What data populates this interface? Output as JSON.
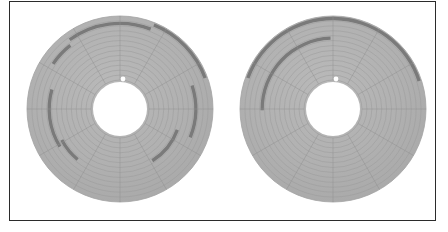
{
  "figure": {
    "kind": "disk-platter-allocation-diagram",
    "background_color": "#ffffff",
    "frame": {
      "border_color": "#2b2b2b",
      "border_width_px": 1,
      "x": 9,
      "y": 1,
      "width": 427,
      "height": 220
    },
    "colors": {
      "platter_fill": "#aeaeae",
      "platter_fill_light": "#b6b6b6",
      "track_line": "#9a9a9a",
      "sector_line": "#8f8f8f",
      "highlight_fill": "#7a7a7a",
      "hub_hole_fill": "#ffffff",
      "index_dot_fill": "#ffffff",
      "platter_edge": "#a2a2a2"
    },
    "geometry": {
      "track_count": 13,
      "sector_count": 12,
      "sector_start_angle_deg": -90
    },
    "platters": [
      {
        "name": "left-platter",
        "label": "fragmented-allocation",
        "cx": 120,
        "cy": 109,
        "r_outer": 93,
        "r_inner": 29,
        "hub_hole_r": 27,
        "index_dot": {
          "dx": 3,
          "dy": -30,
          "r": 2.4
        },
        "highlights": [
          {
            "name": "highlight-arc-1",
            "track": 12,
            "start_deg": -68,
            "end_deg": -20
          },
          {
            "name": "highlight-arc-2",
            "track": 11,
            "start_deg": -126,
            "end_deg": -69
          },
          {
            "name": "highlight-arc-3",
            "track": 10,
            "start_deg": -146,
            "end_deg": -128
          },
          {
            "name": "highlight-arc-4",
            "track": 9,
            "start_deg": -18,
            "end_deg": 22
          },
          {
            "name": "highlight-arc-5",
            "track": 8,
            "start_deg": 148,
            "end_deg": 196
          },
          {
            "name": "highlight-arc-6",
            "track": 7,
            "start_deg": 130,
            "end_deg": 152
          },
          {
            "name": "highlight-arc-7",
            "track": 6,
            "start_deg": 20,
            "end_deg": 58
          }
        ]
      },
      {
        "name": "right-platter",
        "label": "contiguous-allocation",
        "cx": 333,
        "cy": 109,
        "r_outer": 93,
        "r_inner": 29,
        "hub_hole_r": 27,
        "index_dot": {
          "dx": 3,
          "dy": -30,
          "r": 2.4
        },
        "highlights": [
          {
            "name": "highlight-arc-1",
            "track": 12,
            "start_deg": -160,
            "end_deg": -18
          },
          {
            "name": "highlight-arc-2",
            "track": 8,
            "start_deg": -181,
            "end_deg": -92
          }
        ]
      }
    ]
  }
}
